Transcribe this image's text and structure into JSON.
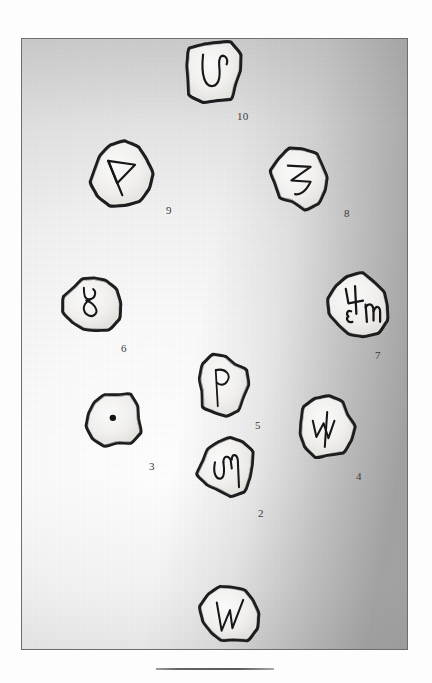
{
  "plate": {
    "caption_rule": "horizontal-rule",
    "frame_border_color": "#6e6e6e",
    "background_note": "gradient-shaded photographic plate, bright at lower-left, dark at right edge"
  },
  "stones": [
    {
      "id": "stone-10",
      "label": "10",
      "glyph_name": "hooked-u-rune",
      "glyph_description": "U-shaped stroke with curled hook at upper right",
      "x": 181,
      "y": 36,
      "w": 62,
      "h": 68,
      "label_x": 236,
      "label_y": 110
    },
    {
      "id": "stone-9",
      "label": "9",
      "glyph_name": "triangular-thorn-rune",
      "glyph_description": "vertical stave with triangular pocket, thorn-like",
      "x": 88,
      "y": 140,
      "w": 64,
      "h": 66,
      "label_x": 165,
      "label_y": 204
    },
    {
      "id": "stone-8",
      "label": "8",
      "glyph_name": "zigzag-z-rune",
      "glyph_description": "Z-like zigzag with descending tail",
      "x": 270,
      "y": 146,
      "w": 60,
      "h": 62,
      "label_x": 343,
      "label_y": 207
    },
    {
      "id": "stone-6",
      "label": "6",
      "glyph_name": "figure-eight-rune",
      "glyph_description": "cursive eight / g-shaped double loop",
      "x": 62,
      "y": 272,
      "w": 58,
      "h": 62,
      "label_x": 120,
      "label_y": 342
    },
    {
      "id": "stone-7",
      "label": "7",
      "glyph_name": "compound-rune-group",
      "glyph_description": "group of three marks: four-like stave, m-like mark, w/omega mark",
      "x": 325,
      "y": 272,
      "w": 66,
      "h": 66,
      "label_x": 374,
      "label_y": 349
    },
    {
      "id": "stone-5",
      "label": "5",
      "glyph_name": "wynn-q-rune",
      "glyph_description": "vertical stave with closed loop at top, q-like",
      "x": 196,
      "y": 353,
      "w": 52,
      "h": 62,
      "label_x": 254,
      "label_y": 419
    },
    {
      "id": "stone-3",
      "label": "3",
      "glyph_name": "single-dot-mark",
      "glyph_description": "one solid drilled dot at centre",
      "x": 84,
      "y": 389,
      "w": 58,
      "h": 58,
      "label_x": 148,
      "label_y": 460
    },
    {
      "id": "stone-4",
      "label": "4",
      "glyph_name": "w-with-stave-rune",
      "glyph_description": "W-like mark crossed by a long vertical stroke",
      "x": 295,
      "y": 395,
      "w": 60,
      "h": 62,
      "label_x": 355,
      "label_y": 470
    },
    {
      "id": "stone-2",
      "label": "2",
      "glyph_name": "cursive-m-rune",
      "glyph_description": "rounded m with long right leg",
      "x": 196,
      "y": 434,
      "w": 60,
      "h": 62,
      "label_x": 257,
      "label_y": 507
    },
    {
      "id": "stone-1",
      "label": "",
      "glyph_name": "lightning-zigzag-rune",
      "glyph_description": "angular lightning-like zigzag, W/N form",
      "x": 199,
      "y": 581,
      "w": 60,
      "h": 64,
      "label_x": 0,
      "label_y": 0
    }
  ]
}
